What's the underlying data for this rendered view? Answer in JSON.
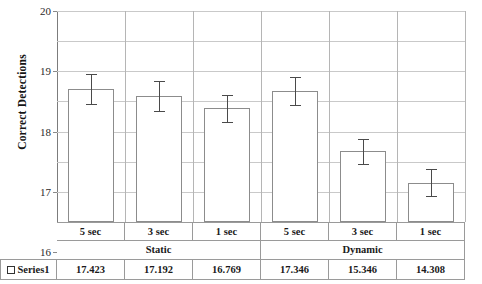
{
  "chart_data": {
    "type": "bar",
    "title": "",
    "xlabel": "",
    "ylabel": "Correct Detections",
    "ylim": [
      13,
      20
    ],
    "yticks": [
      13,
      14,
      15,
      16,
      17,
      18,
      19,
      20
    ],
    "grid": true,
    "legend": "Series1",
    "legend_position": "bottom-left-table",
    "groups": [
      {
        "name": "Static",
        "categories": [
          "5 sec",
          "3 sec",
          "1 sec"
        ]
      },
      {
        "name": "Dynamic",
        "categories": [
          "5 sec",
          "3 sec",
          "1 sec"
        ]
      }
    ],
    "categories": [
      "5 sec",
      "3 sec",
      "1 sec",
      "5 sec",
      "3 sec",
      "1 sec"
    ],
    "series": [
      {
        "name": "Series1",
        "values": [
          17.423,
          17.192,
          16.769,
          17.346,
          15.346,
          14.308
        ],
        "value_labels": [
          "17.423",
          "17.192",
          "16.769",
          "17.346",
          "15.346",
          "14.308"
        ],
        "errors": [
          0.5,
          0.5,
          0.46,
          0.45,
          0.42,
          0.45
        ]
      }
    ]
  },
  "axis": {
    "y_title": "Correct Detections",
    "y_tick_labels": [
      "20",
      "19",
      "18",
      "17",
      "16",
      "15",
      "14",
      "13"
    ]
  },
  "table": {
    "series_label": "Series1",
    "sub_headers": [
      "5 sec",
      "3 sec",
      "1 sec",
      "5 sec",
      "3 sec",
      "1 sec"
    ],
    "group_headers": [
      "Static",
      "Dynamic"
    ],
    "values": [
      "17.423",
      "17.192",
      "16.769",
      "17.346",
      "15.346",
      "14.308"
    ]
  },
  "colors": {
    "bar_fill": "#ffffff",
    "bar_stroke": "#8c8c8c",
    "error_bar": "#4a4a4a",
    "gridline": "#c9c9c9",
    "axis": "#6f6f6f",
    "text": "#1a1a1a"
  }
}
